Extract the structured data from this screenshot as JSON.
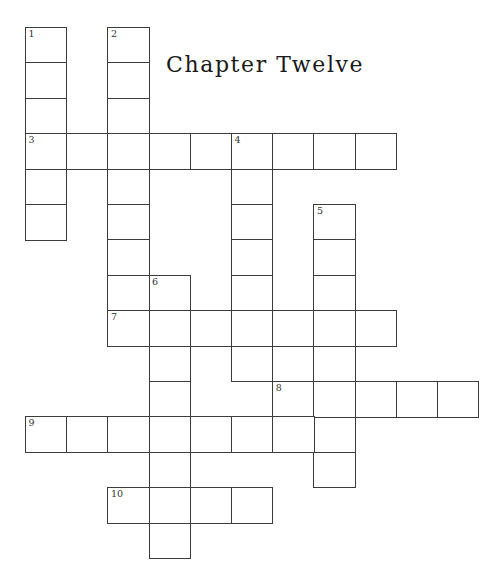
{
  "page": {
    "title": "Chapter Twelve",
    "background_color": "#ffffff",
    "width": 491,
    "height": 582
  },
  "grid": {
    "cell_width": 41.2,
    "cell_height": 35.4,
    "origin_x": 25,
    "origin_y": 27,
    "line_color": "#3c3c3c",
    "cell_fill": "#ffffff",
    "number_color": "#333333"
  },
  "entries": [
    {
      "number": "1",
      "direction": "down",
      "col": 0,
      "row": 0,
      "length": 6
    },
    {
      "number": "2",
      "direction": "down",
      "col": 2,
      "row": 0,
      "length": 8
    },
    {
      "number": "3",
      "direction": "across",
      "col": 0,
      "row": 3,
      "length": 9
    },
    {
      "number": "4",
      "direction": "down",
      "col": 5,
      "row": 3,
      "length": 7
    },
    {
      "number": "5",
      "direction": "down",
      "col": 7,
      "row": 5,
      "length": 8
    },
    {
      "number": "6",
      "direction": "down",
      "col": 3,
      "row": 7,
      "length": 8
    },
    {
      "number": "7",
      "direction": "across",
      "col": 2,
      "row": 8,
      "length": 7
    },
    {
      "number": "8",
      "direction": "across",
      "col": 6,
      "row": 10,
      "length": 5
    },
    {
      "number": "9",
      "direction": "across",
      "col": 0,
      "row": 11,
      "length": 7
    },
    {
      "number": "10",
      "direction": "across",
      "col": 2,
      "row": 13,
      "length": 4
    }
  ],
  "cells": [
    {
      "col": 0,
      "row": 0,
      "number": "1"
    },
    {
      "col": 0,
      "row": 1,
      "number": ""
    },
    {
      "col": 0,
      "row": 2,
      "number": ""
    },
    {
      "col": 0,
      "row": 3,
      "number": "3"
    },
    {
      "col": 0,
      "row": 4,
      "number": ""
    },
    {
      "col": 0,
      "row": 5,
      "number": ""
    },
    {
      "col": 2,
      "row": 0,
      "number": "2"
    },
    {
      "col": 2,
      "row": 1,
      "number": ""
    },
    {
      "col": 2,
      "row": 2,
      "number": ""
    },
    {
      "col": 2,
      "row": 4,
      "number": ""
    },
    {
      "col": 2,
      "row": 5,
      "number": ""
    },
    {
      "col": 2,
      "row": 6,
      "number": ""
    },
    {
      "col": 2,
      "row": 7,
      "number": ""
    },
    {
      "col": 1,
      "row": 3,
      "number": ""
    },
    {
      "col": 2,
      "row": 3,
      "number": ""
    },
    {
      "col": 3,
      "row": 3,
      "number": ""
    },
    {
      "col": 4,
      "row": 3,
      "number": ""
    },
    {
      "col": 5,
      "row": 3,
      "number": "4"
    },
    {
      "col": 6,
      "row": 3,
      "number": ""
    },
    {
      "col": 7,
      "row": 3,
      "number": ""
    },
    {
      "col": 8,
      "row": 3,
      "number": ""
    },
    {
      "col": 5,
      "row": 4,
      "number": ""
    },
    {
      "col": 5,
      "row": 5,
      "number": ""
    },
    {
      "col": 5,
      "row": 6,
      "number": ""
    },
    {
      "col": 5,
      "row": 7,
      "number": ""
    },
    {
      "col": 5,
      "row": 9,
      "number": ""
    },
    {
      "col": 7,
      "row": 5,
      "number": "5"
    },
    {
      "col": 7,
      "row": 6,
      "number": ""
    },
    {
      "col": 7,
      "row": 7,
      "number": ""
    },
    {
      "col": 7,
      "row": 9,
      "number": ""
    },
    {
      "col": 7,
      "row": 11,
      "number": ""
    },
    {
      "col": 7,
      "row": 12,
      "number": ""
    },
    {
      "col": 3,
      "row": 7,
      "number": "6"
    },
    {
      "col": 3,
      "row": 9,
      "number": ""
    },
    {
      "col": 3,
      "row": 10,
      "number": ""
    },
    {
      "col": 3,
      "row": 12,
      "number": ""
    },
    {
      "col": 3,
      "row": 14,
      "number": ""
    },
    {
      "col": 2,
      "row": 8,
      "number": "7"
    },
    {
      "col": 3,
      "row": 8,
      "number": ""
    },
    {
      "col": 4,
      "row": 8,
      "number": ""
    },
    {
      "col": 5,
      "row": 8,
      "number": ""
    },
    {
      "col": 6,
      "row": 8,
      "number": ""
    },
    {
      "col": 7,
      "row": 8,
      "number": ""
    },
    {
      "col": 8,
      "row": 8,
      "number": ""
    },
    {
      "col": 6,
      "row": 10,
      "number": "8"
    },
    {
      "col": 7,
      "row": 10,
      "number": ""
    },
    {
      "col": 8,
      "row": 10,
      "number": ""
    },
    {
      "col": 9,
      "row": 10,
      "number": ""
    },
    {
      "col": 10,
      "row": 10,
      "number": ""
    },
    {
      "col": 0,
      "row": 11,
      "number": "9"
    },
    {
      "col": 1,
      "row": 11,
      "number": ""
    },
    {
      "col": 2,
      "row": 11,
      "number": ""
    },
    {
      "col": 3,
      "row": 11,
      "number": ""
    },
    {
      "col": 4,
      "row": 11,
      "number": ""
    },
    {
      "col": 5,
      "row": 11,
      "number": ""
    },
    {
      "col": 6,
      "row": 11,
      "number": ""
    },
    {
      "col": 2,
      "row": 13,
      "number": "10"
    },
    {
      "col": 3,
      "row": 13,
      "number": ""
    },
    {
      "col": 4,
      "row": 13,
      "number": ""
    },
    {
      "col": 5,
      "row": 13,
      "number": ""
    }
  ]
}
